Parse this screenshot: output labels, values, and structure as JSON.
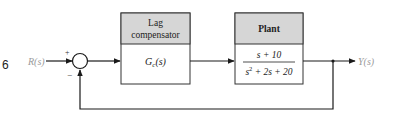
{
  "figure_number_fragment": "6",
  "input": {
    "label": "R(s)"
  },
  "output": {
    "label": "Y(s)"
  },
  "summing_junction": {
    "plus_sign": "+",
    "minus_sign": "−"
  },
  "blocks": [
    {
      "title_line1": "Lag",
      "title_line2": "compensator",
      "tf_symbol": "G",
      "tf_subscript": "c",
      "tf_arg": "(s)"
    },
    {
      "title": "Plant",
      "numerator": "s + 10",
      "denominator_s": "s",
      "denominator_exp": "2",
      "denominator_rest": " + 2s + 20"
    }
  ],
  "colors": {
    "header_fill": "#d6d6d6",
    "line": "#1a1a1a",
    "signal_label": "#9a9a9a"
  }
}
